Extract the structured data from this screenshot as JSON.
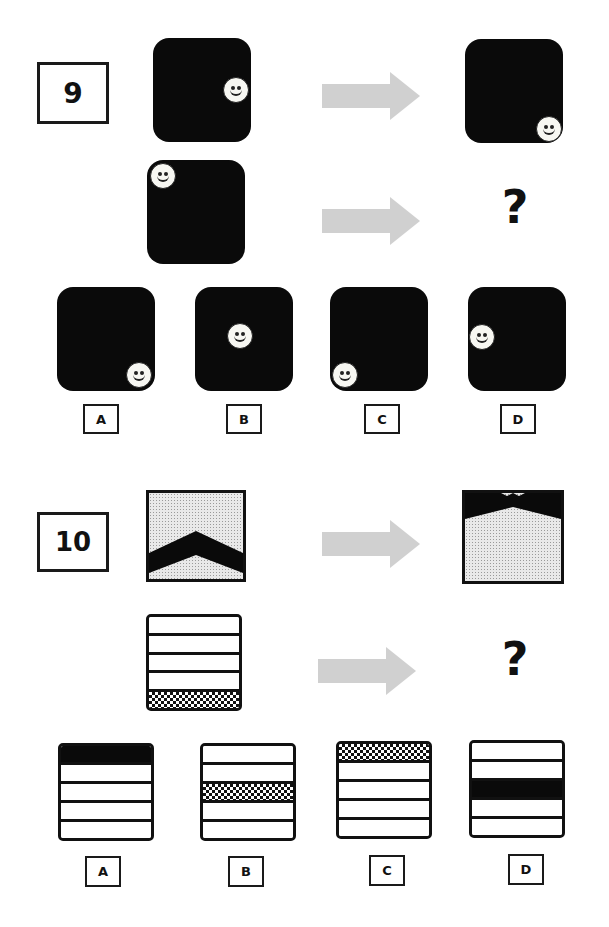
{
  "puzzle9": {
    "number": "9",
    "example": {
      "input": {
        "smiley_position": "right-middle"
      },
      "output": {
        "smiley_position": "bottom-right"
      }
    },
    "question": {
      "input": {
        "smiley_position": "top-left"
      },
      "output": "?"
    },
    "options": [
      {
        "label": "A",
        "smiley_position": "bottom-right"
      },
      {
        "label": "B",
        "smiley_position": "center"
      },
      {
        "label": "C",
        "smiley_position": "bottom-left"
      },
      {
        "label": "D",
        "smiley_position": "left-middle"
      }
    ]
  },
  "puzzle10": {
    "number": "10",
    "example": {
      "input": {
        "chevron_position": "bottom"
      },
      "output": {
        "chevron_position": "top"
      }
    },
    "question": {
      "input": {
        "rows": [
          "white",
          "white",
          "white",
          "white",
          "checker"
        ]
      },
      "output": "?"
    },
    "options": [
      {
        "label": "A",
        "rows": [
          "black",
          "white",
          "white",
          "white",
          "white"
        ]
      },
      {
        "label": "B",
        "rows": [
          "white",
          "white",
          "checker",
          "white",
          "white"
        ]
      },
      {
        "label": "C",
        "rows": [
          "checker",
          "white",
          "white",
          "white",
          "white"
        ]
      },
      {
        "label": "D",
        "rows": [
          "white",
          "white",
          "black",
          "white",
          "white"
        ]
      }
    ]
  },
  "colors": {
    "panel": "#0a0a0a",
    "arrow": "#d0d0d0",
    "border": "#1a1a1a"
  }
}
